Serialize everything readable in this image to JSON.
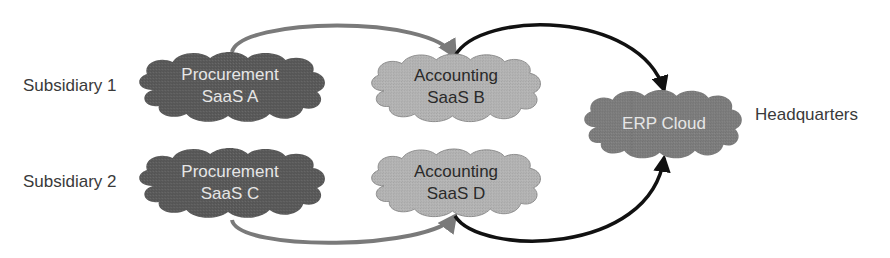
{
  "labels": {
    "subsidiary_1": "Subsidiary 1",
    "subsidiary_2": "Subsidiary 2",
    "headquarters": "Headquarters"
  },
  "nodes": [
    {
      "id": "procurement_a",
      "line1": "Procurement",
      "line2": "SaaS A",
      "tone": "dark"
    },
    {
      "id": "accounting_b",
      "line1": "Accounting",
      "line2": "SaaS B",
      "tone": "light"
    },
    {
      "id": "procurement_c",
      "line1": "Procurement",
      "line2": "SaaS C",
      "tone": "dark"
    },
    {
      "id": "accounting_d",
      "line1": "Accounting",
      "line2": "SaaS D",
      "tone": "light"
    },
    {
      "id": "erp_cloud",
      "line1": "ERP Cloud",
      "tone": "medium"
    }
  ],
  "edges": [
    {
      "from": "procurement_a",
      "to": "accounting_b",
      "color": "#7a7a7a"
    },
    {
      "from": "accounting_b",
      "to": "erp_cloud",
      "color": "#111111"
    },
    {
      "from": "procurement_c",
      "to": "accounting_d",
      "color": "#7a7a7a"
    },
    {
      "from": "accounting_d",
      "to": "erp_cloud",
      "color": "#111111"
    }
  ],
  "colors": {
    "cloud_dark": "#5a5a5a",
    "cloud_light": "#b4b4b4",
    "cloud_medium": "#7d7d7d",
    "arrow_gray": "#7a7a7a",
    "arrow_black": "#111111",
    "text": "#3a3a3a"
  }
}
